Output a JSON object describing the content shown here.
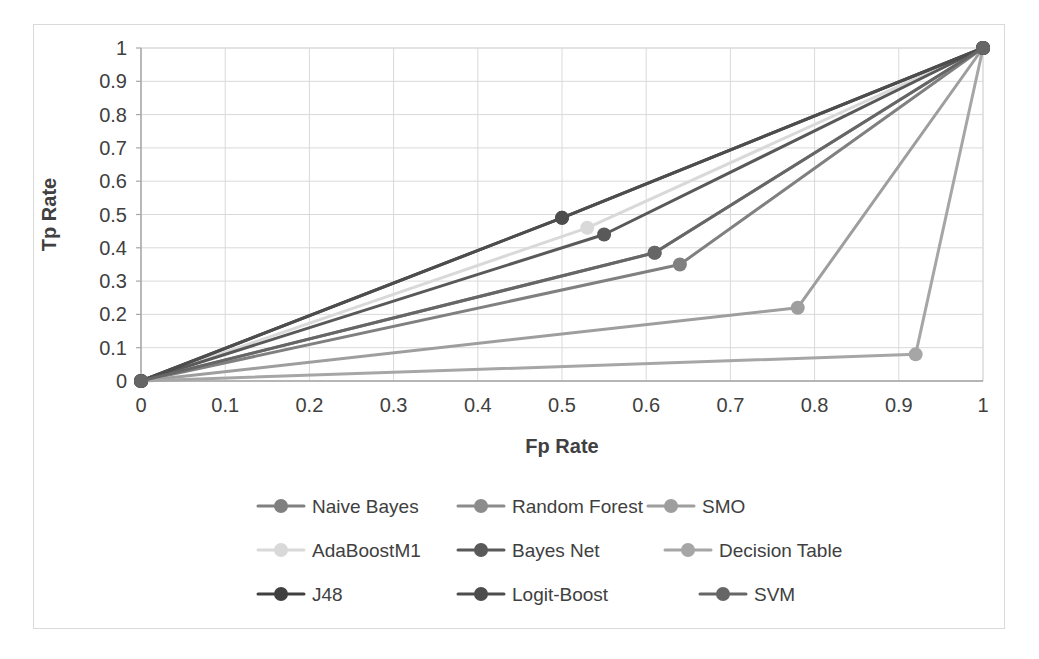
{
  "chart_data": {
    "type": "line",
    "title": "",
    "xlabel": "Fp Rate",
    "ylabel": "Tp Rate",
    "xlim": [
      0,
      1
    ],
    "ylim": [
      0,
      1
    ],
    "xticks": [
      "0",
      "0.1",
      "0.2",
      "0.3",
      "0.4",
      "0.5",
      "0.6",
      "0.7",
      "0.8",
      "0.9",
      "1"
    ],
    "yticks": [
      "0",
      "0.1",
      "0.2",
      "0.3",
      "0.4",
      "0.5",
      "0.6",
      "0.7",
      "0.8",
      "0.9",
      "1"
    ],
    "xtick_values": [
      0,
      0.1,
      0.2,
      0.3,
      0.4,
      0.5,
      0.6,
      0.7,
      0.8,
      0.9,
      1
    ],
    "ytick_values": [
      0,
      0.1,
      0.2,
      0.3,
      0.4,
      0.5,
      0.6,
      0.7,
      0.8,
      0.9,
      1
    ],
    "grid": true,
    "legend_position": "bottom",
    "markers": "circle",
    "series": [
      {
        "name": "Naive Bayes",
        "color": "#808080",
        "x": [
          0,
          0.64,
          1
        ],
        "y": [
          0,
          0.35,
          1
        ]
      },
      {
        "name": "Random Forest",
        "color": "#8c8c8c",
        "x": [
          0,
          0.61,
          1
        ],
        "y": [
          0,
          0.385,
          1
        ]
      },
      {
        "name": "SMO",
        "color": "#9e9e9e",
        "x": [
          0,
          0.78,
          1
        ],
        "y": [
          0,
          0.22,
          1
        ]
      },
      {
        "name": "AdaBoostM1",
        "color": "#d9d9d9",
        "x": [
          0,
          0.53,
          1
        ],
        "y": [
          0,
          0.46,
          1
        ]
      },
      {
        "name": "Bayes Net",
        "color": "#595959",
        "x": [
          0,
          0.55,
          1
        ],
        "y": [
          0,
          0.44,
          1
        ]
      },
      {
        "name": "Decision Table",
        "color": "#a6a6a6",
        "x": [
          0,
          0.92,
          1
        ],
        "y": [
          0,
          0.08,
          1
        ]
      },
      {
        "name": "J48",
        "color": "#404040",
        "x": [
          0,
          0.5,
          1
        ],
        "y": [
          0,
          0.49,
          1
        ]
      },
      {
        "name": "Logit-Boost",
        "color": "#4d4d4d",
        "x": [
          0,
          0.5,
          1
        ],
        "y": [
          0,
          0.49,
          1
        ]
      },
      {
        "name": "SVM",
        "color": "#666666",
        "x": [
          0,
          0.61,
          1
        ],
        "y": [
          0,
          0.385,
          1
        ]
      }
    ]
  },
  "legend": {
    "rows": [
      [
        "Naive Bayes",
        "Random Forest",
        "SMO"
      ],
      [
        "AdaBoostM1",
        "Bayes Net",
        "Decision Table"
      ],
      [
        "J48",
        "Logit-Boost",
        "SVM"
      ]
    ]
  }
}
